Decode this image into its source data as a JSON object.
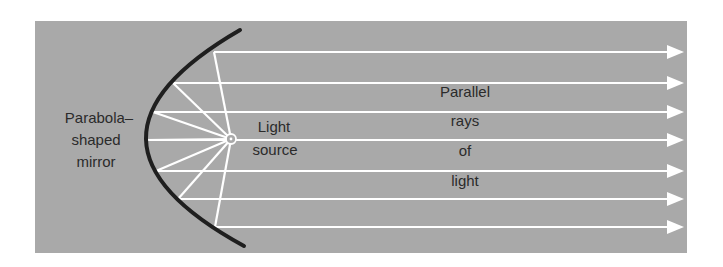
{
  "diagram": {
    "colors": {
      "background": "#ffffff",
      "panel": "#a9a9a9",
      "mirror": "#1f1f1f",
      "rays": "#ffffff",
      "text": "#2b2b2b"
    },
    "labels": {
      "mirror": [
        "Parabola–",
        "shaped",
        "mirror"
      ],
      "source": [
        "Light",
        "source"
      ],
      "rays": [
        "Parallel",
        "rays",
        "of",
        "light"
      ]
    },
    "light_source": {
      "x": 231,
      "y": 139
    },
    "rays": [
      {
        "mirror_x": 214,
        "y": 52
      },
      {
        "mirror_x": 173,
        "y": 83
      },
      {
        "mirror_x": 153,
        "y": 112
      },
      {
        "mirror_x": 145,
        "y": 140
      },
      {
        "mirror_x": 156,
        "y": 171
      },
      {
        "mirror_x": 178,
        "y": 199
      },
      {
        "mirror_x": 215,
        "y": 227
      }
    ],
    "ray_count": 7
  }
}
